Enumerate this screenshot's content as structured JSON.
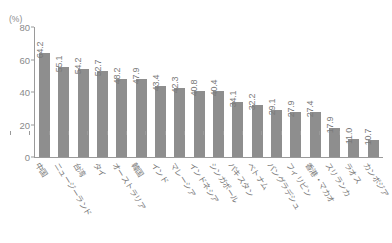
{
  "chart_data": {
    "type": "bar",
    "title": "",
    "xlabel": "",
    "ylabel": "(%)",
    "ylim": [
      0,
      80
    ],
    "yticks": [
      0,
      20,
      40,
      60,
      80
    ],
    "grid": false,
    "legend": null,
    "bar_color": "#8e8e8e",
    "axis_color": "#9a9a9a",
    "text_color": "#7d7d7d",
    "categories": [
      "中国",
      "ニュージーランド",
      "台湾",
      "タイ",
      "オーストラリア",
      "韓国",
      "インド",
      "マレーシア",
      "インドネシア",
      "シンガポール",
      "パキスタン",
      "ベトナム",
      "バングラデシュ",
      "フィリピン",
      "香港・マカオ",
      "スリランカ",
      "ラオス",
      "カンボジア"
    ],
    "values": [
      64.2,
      55.1,
      54.2,
      52.7,
      48.2,
      47.9,
      43.4,
      42.3,
      40.8,
      40.4,
      34.1,
      32.2,
      29.1,
      27.9,
      27.4,
      17.9,
      11.0,
      10.7
    ],
    "value_labels": [
      "64.2",
      "55.1",
      "54.2",
      "52.7",
      "48.2",
      "47.9",
      "43.4",
      "42.3",
      "40.8",
      "40.4",
      "34.1",
      "32.2",
      "29.1",
      "27.9",
      "27.4",
      "17.9",
      "11.0",
      "10.7"
    ],
    "ytick_labels": [
      "0",
      "20",
      "40",
      "60",
      "80"
    ]
  },
  "axis": {
    "unit_label": "(%)"
  }
}
